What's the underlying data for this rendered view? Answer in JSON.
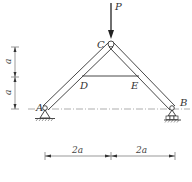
{
  "diagram": {
    "type": "truss",
    "colors": {
      "line": "#333333",
      "dim": "#555555",
      "background": "#ffffff"
    },
    "load": {
      "label": "P",
      "direction": "down",
      "at": "C"
    },
    "nodes": {
      "A": {
        "label": "A",
        "support": "pin"
      },
      "B": {
        "label": "B",
        "support": "roller"
      },
      "C": {
        "label": "C",
        "type": "hinge"
      },
      "D": {
        "label": "D"
      },
      "E": {
        "label": "E"
      }
    },
    "members": [
      "AC",
      "CB",
      "DE"
    ],
    "dimensions": {
      "vertical": [
        {
          "label": "a"
        },
        {
          "label": "a"
        }
      ],
      "horizontal": [
        {
          "label": "2a"
        },
        {
          "label": "2a"
        }
      ]
    }
  }
}
